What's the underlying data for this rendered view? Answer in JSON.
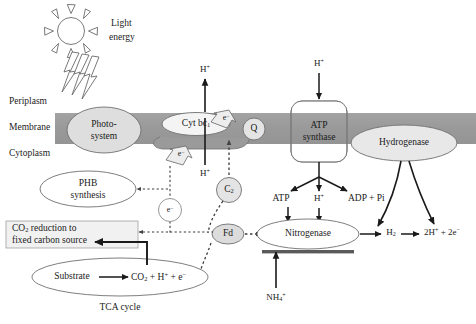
{
  "figure": {
    "type": "biological-pathway-diagram"
  },
  "colors": {
    "membrane_fill": "#9c9c9c",
    "node_fill": "#e6e6e6",
    "node_stroke": "#777777",
    "box_fill": "#f0f0f0",
    "box_stroke": "#999999",
    "arrow_solid": "#1a1a1a",
    "arrow_dotted": "#555555",
    "text": "#1a1a1a",
    "bar_dark": "#4a4a4a",
    "background": "#ffffff"
  },
  "compartments": [
    {
      "id": "periplasm",
      "label": "Periplasm"
    },
    {
      "id": "membrane",
      "label": "Membrane"
    },
    {
      "id": "cytoplasm",
      "label": "Cytoplasm"
    }
  ],
  "light": {
    "icon": "sun-icon",
    "label_line1": "Light",
    "label_line2": "energy",
    "bolt_count": 3
  },
  "membrane_complexes": [
    {
      "id": "photosystem",
      "label_line1": "Photo-",
      "label_line2": "system",
      "shape": "ellipse"
    },
    {
      "id": "cyt-bc1",
      "label": "Cyt bc",
      "subscript": "1",
      "shape": "ellipse"
    },
    {
      "id": "quinone",
      "label": "Q",
      "shape": "circle"
    },
    {
      "id": "atp-synthase",
      "label_line1": "ATP",
      "label_line2": "synthase",
      "shape": "rounded-rect"
    },
    {
      "id": "hydrogenase",
      "label": "Hydrogenase",
      "shape": "ellipse"
    }
  ],
  "cytoplasm_nodes": [
    {
      "id": "phb-synthesis",
      "label_line1": "PHB",
      "label_line2": "synthesis",
      "shape": "ellipse"
    },
    {
      "id": "co2-reduction",
      "label_line1": "CO",
      "label_line1_sub": "2",
      "label_line1_rest": " reduction to",
      "label_line2": "fixed carbon source",
      "shape": "rect"
    },
    {
      "id": "tca-ellipse",
      "label_left": "Substrate",
      "label_right_pre": "CO",
      "label_right_sub": "2",
      "label_right_post": " + H",
      "label_right_sup": "+",
      "label_right_tail": " + e",
      "label_right_sup2": "−",
      "shape": "ellipse"
    },
    {
      "id": "nitrogenase",
      "label": "Nitrogenase",
      "shape": "ellipse"
    },
    {
      "id": "carrier-c2",
      "label": "C",
      "subscript": "2",
      "shape": "circle"
    },
    {
      "id": "ferredoxin",
      "label": "Fd",
      "shape": "ellipse"
    },
    {
      "id": "electron-circle",
      "label": "e",
      "superscript": "−",
      "shape": "circle"
    }
  ],
  "species": [
    {
      "id": "proton-out-top",
      "text": "H+",
      "html": "H<sup>+</sup>"
    },
    {
      "id": "proton-in-bottom",
      "text": "H+",
      "html": "H<sup>+</sup>"
    },
    {
      "id": "proton-atp-top",
      "text": "H+",
      "html": "H<sup>+</sup>"
    },
    {
      "id": "proton-atp-bottom",
      "text": "H+",
      "html": "H<sup>+</sup>"
    },
    {
      "id": "atp-product",
      "text": "ATP",
      "html": "ATP"
    },
    {
      "id": "adp-pi",
      "text": "ADP + Pi",
      "html": "ADP + Pi"
    },
    {
      "id": "hydrogen-gas",
      "text": "H2",
      "html": "H<sub>2</sub>"
    },
    {
      "id": "protons-electrons",
      "text": "2H+ + 2e-",
      "html": "2H<sup>+</sup> + 2e<sup>−</sup>"
    },
    {
      "id": "ammonium",
      "text": "NH4+",
      "html": "NH<sub>4</sub><sup>+</sup>"
    },
    {
      "id": "electron-cytbc1-upper",
      "text": "e-",
      "html": "e<sup>−</sup>"
    },
    {
      "id": "electron-cytbc1-lower",
      "text": "e-",
      "html": "e<sup>−</sup>"
    }
  ],
  "caption": {
    "tca_cycle": "TCA cycle"
  }
}
